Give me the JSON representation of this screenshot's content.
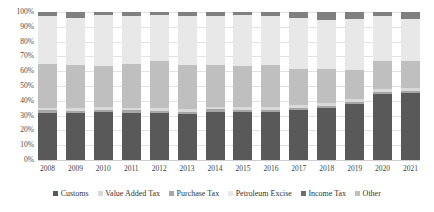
{
  "chart_data": {
    "type": "bar",
    "subtype": "stacked-percentage",
    "title": "",
    "xlabel": "",
    "ylabel": "",
    "ylim": [
      0,
      100
    ],
    "ytick_labels": [
      "100%",
      "90%",
      "80%",
      "70%",
      "60%",
      "50%",
      "40%",
      "30%",
      "20%",
      "10%",
      "0%"
    ],
    "ytick_values": [
      100,
      90,
      80,
      70,
      60,
      50,
      40,
      30,
      20,
      10,
      0
    ],
    "grid": true,
    "legend_position": "bottom",
    "categories": [
      "2008",
      "2009",
      "2010",
      "2011",
      "2012",
      "2013",
      "2014",
      "2015",
      "2016",
      "2017",
      "2018",
      "2019",
      "2020",
      "2021"
    ],
    "series": [
      {
        "name": "Customs",
        "color": "#595959",
        "values": [
          1.0,
          1.0,
          1.0,
          1.0,
          1.0,
          1.0,
          1.0,
          1.0,
          1.0,
          1.0,
          1.0,
          1.0,
          1.0,
          1.0
        ]
      },
      {
        "name": "Value Added Tax",
        "color": "#595959",
        "values": [
          32.0,
          32.0,
          32.0,
          32.0,
          31.5,
          31.0,
          32.5,
          32.0,
          32.5,
          34.0,
          36.5,
          39.0,
          45.0,
          46.5
        ]
      },
      {
        "name": "Purchase Tax",
        "color": "#a6a6a6",
        "values": [
          1.5,
          1.5,
          1.5,
          1.5,
          1.5,
          1.5,
          1.5,
          1.5,
          1.5,
          1.5,
          1.5,
          1.5,
          1.5,
          1.5
        ]
      },
      {
        "name": "Petroleum Excise",
        "color": "#d9d9d9",
        "values": [
          2.0,
          2.0,
          2.0,
          2.0,
          2.0,
          2.0,
          2.0,
          2.0,
          2.0,
          2.0,
          2.0,
          2.0,
          2.0,
          2.0
        ]
      },
      {
        "name": "Income Tax",
        "color": "#bfbfbf",
        "values": [
          30.5,
          30.5,
          28.5,
          30.5,
          32.0,
          30.5,
          29.0,
          28.5,
          29.0,
          25.5,
          24.0,
          20.5,
          19.5,
          19.0
        ]
      },
      {
        "name": "Other",
        "color": "#e8e8e8",
        "values": [
          33.0,
          33.0,
          35.0,
          33.0,
          32.0,
          34.0,
          34.0,
          35.0,
          34.0,
          36.0,
          35.0,
          36.0,
          31.0,
          30.0
        ]
      }
    ],
    "top_cap": {
      "name": "Other (dark cap)",
      "color": "#808080",
      "values": [
        3.0,
        4.0,
        2.0,
        3.0,
        2.0,
        2.5,
        2.5,
        2.0,
        3.0,
        4.0,
        6.0,
        5.0,
        3.0,
        5.0
      ]
    }
  },
  "legend": {
    "items": [
      {
        "label": "Customs",
        "color": "#595959"
      },
      {
        "label": "Value Added Tax",
        "color": "#d9d9d9"
      },
      {
        "label": "Purchase Tax",
        "color": "#a6a6a6"
      },
      {
        "label": "Petroleum Excise",
        "color": "#e8e8e8"
      },
      {
        "label": "Income Tax",
        "color": "#6f6f6f"
      },
      {
        "label": "Other",
        "color": "#bfbfbf"
      }
    ]
  }
}
